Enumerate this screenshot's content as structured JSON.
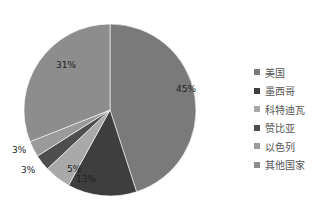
{
  "chart_data": {
    "type": "pie",
    "title": "",
    "categories": [
      "美国",
      "墨西哥",
      "科特迪瓦",
      "赞比亚",
      "以色列",
      "其他国家"
    ],
    "values": [
      45,
      13,
      5,
      3,
      3,
      31
    ],
    "labels": [
      "45%",
      "13%",
      "5%",
      "3%",
      "3%",
      "31%"
    ],
    "colors": [
      "#7a7a7a",
      "#3e3e3e",
      "#a9a9a9",
      "#4e4e4e",
      "#9a9a9a",
      "#8d8d8d"
    ],
    "start_angle": "12 o'clock",
    "direction": "clockwise",
    "legend_position": "right"
  },
  "legend": {
    "items": [
      {
        "label": "美国",
        "color": "#7a7a7a"
      },
      {
        "label": "墨西哥",
        "color": "#3e3e3e"
      },
      {
        "label": "科特迪瓦",
        "color": "#a9a9a9"
      },
      {
        "label": "赞比亚",
        "color": "#4e4e4e"
      },
      {
        "label": "以色列",
        "color": "#9a9a9a"
      },
      {
        "label": "其他国家",
        "color": "#8d8d8d"
      }
    ]
  }
}
